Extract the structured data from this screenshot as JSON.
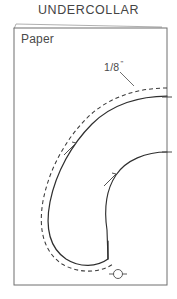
{
  "document": {
    "title": "UNDERCOLLAR",
    "kind": "sewing-pattern-piece-diagram"
  },
  "labels": {
    "paper": "Paper",
    "seam_allowance_value": "1/8",
    "seam_allowance_unit": "\"",
    "seam_allowance_full": "1/8 \""
  },
  "colors": {
    "frame_stroke": "#6f6f6f",
    "cut_line_stroke": "#2f2f2f",
    "stitch_line_stroke": "#3a3a3a",
    "notch_stroke": "#4a4a4a",
    "leader_stroke": "#555555",
    "text": "#444444",
    "background": "#ffffff"
  },
  "frame": {
    "x": 14,
    "y": 28,
    "width": 153,
    "height": 257,
    "fold_line_note": "thin paper edge line above top of frame"
  },
  "markings": {
    "edge_ticks": [
      {
        "name": "edge-tick-upper",
        "x": 167,
        "y": 97
      },
      {
        "name": "edge-tick-lower",
        "x": 167,
        "y": 152
      }
    ],
    "notches": [
      {
        "name": "notch-outer-curve",
        "x": 70,
        "y": 149
      },
      {
        "name": "notch-inner-curve",
        "x": 110,
        "y": 180
      }
    ],
    "grain_symbol": {
      "name": "center-mark-circle",
      "cx": 118,
      "cy": 274,
      "r": 4.5,
      "line_half_width": 9
    },
    "leader_line": {
      "from": [
        120,
        72
      ],
      "to": [
        134,
        86
      ]
    }
  },
  "geometry": {
    "cut_line_path": "M 167 96 C 140 96 112 104 92 124 C 72 144 56 172 50 202 C 45 228 50 248 66 259 C 80 268 97 267 108 259 L 108 241",
    "stitch_line_path": "M 167 88 C 138 88 108 97 87 118 C 66 139 49 169 43 201 C 38 230 44 252 62 264 C 79 274 100 273 113 264",
    "inner_curve_path": "M 167 152 C 146 152 126 160 116 175 C 106 190 104 210 107 230 L 108 259"
  }
}
